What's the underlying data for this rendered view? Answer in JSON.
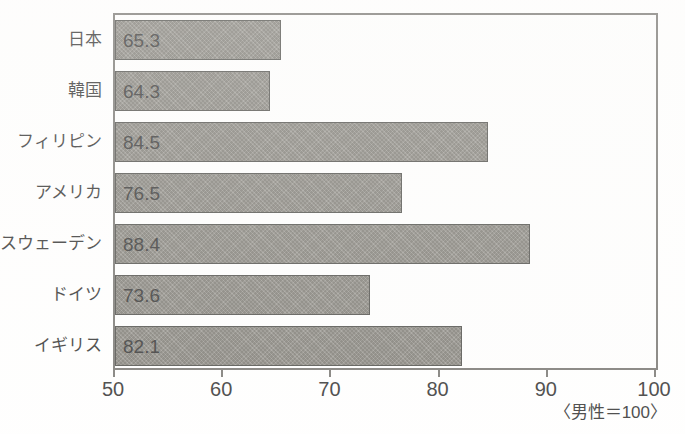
{
  "chart_data": {
    "type": "bar",
    "orientation": "horizontal",
    "title": "",
    "subtitle": "",
    "xlabel": "",
    "ylabel": "",
    "xlim": [
      50,
      100
    ],
    "grid": false,
    "legend": null,
    "note": "〈男性＝100〉",
    "categories": [
      "日本",
      "韓国",
      "フィリピン",
      "アメリカ",
      "スウェーデン",
      "ドイツ",
      "イギリス"
    ],
    "values": [
      65.3,
      64.3,
      84.5,
      76.5,
      88.4,
      73.6,
      82.1
    ],
    "value_labels": [
      "65.3",
      "64.3",
      "84.5",
      "76.5",
      "88.4",
      "73.6",
      "82.1"
    ],
    "xticks": [
      50,
      60,
      70,
      80,
      90,
      100
    ],
    "xtick_labels": [
      "50",
      "60",
      "70",
      "80",
      "90",
      "100"
    ],
    "bar_color": "#807d76",
    "bar_border_color": "#40403c",
    "frame_color": "#6e6c68",
    "text_color": "#242424",
    "background_color": "#ffffff"
  }
}
